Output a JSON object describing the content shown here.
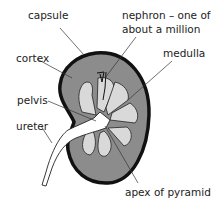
{
  "diagram": {
    "labels": {
      "capsule": "capsule",
      "nephron_line1": "nephron – one of",
      "nephron_line2": "about a million",
      "cortex": "cortex",
      "medulla": "medulla",
      "pelvis": "pelvis",
      "ureter": "ureter",
      "apex": "apex of pyramid"
    },
    "colors": {
      "outline": "#111111",
      "cortex": "#8c8c8c",
      "pyramid": "#d9d9d9",
      "pelvis": "#ffffff",
      "leader": "#333333"
    }
  }
}
